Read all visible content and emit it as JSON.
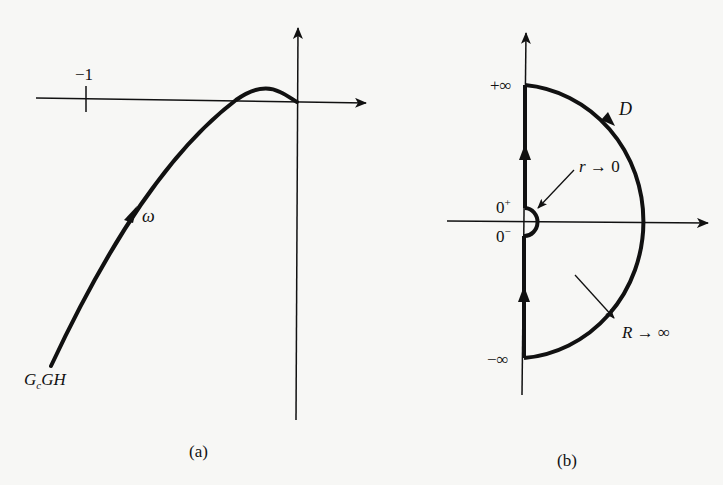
{
  "panel_a": {
    "caption": "(a)",
    "minus_one_label": "−1",
    "omega_label": "ω",
    "curve_label_main": "G",
    "curve_label_sub": "c",
    "curve_label_rest": "GH"
  },
  "panel_b": {
    "caption": "(b)",
    "plus_inf_label": "+∞",
    "minus_inf_label": "−∞",
    "zero_plus_base": "0",
    "zero_plus_sup": "+",
    "zero_minus_base": "0",
    "zero_minus_sup": "−",
    "contour_label": "D",
    "small_radius_label": "r → 0",
    "large_radius_label": "R → ∞"
  },
  "colors": {
    "ink": "#111111",
    "paper": "#f7f7f5"
  }
}
